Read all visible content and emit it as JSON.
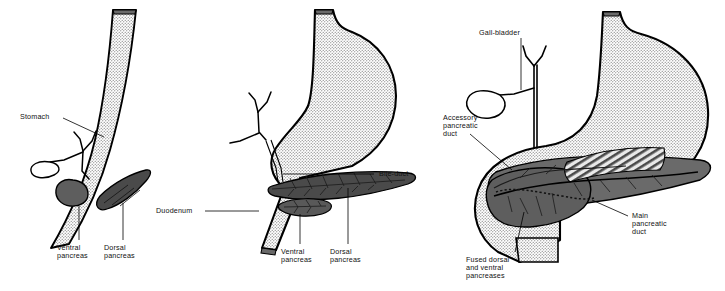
{
  "figure": {
    "type": "anatomical-diagram",
    "panel_count": 3,
    "colors": {
      "outline": "#000000",
      "stipple_fill": "#e8e8e8",
      "pancreas_dark": "#4d4d4d",
      "pancreas_mid": "#6f6f6f",
      "pancreas_light": "#8a8a8a",
      "label_text": "#111111",
      "background": "#ffffff"
    }
  },
  "panels": [
    {
      "id": "panel-left",
      "name": "early-stage",
      "labels": {
        "stomach": "Stomach",
        "ventral_pancreas": "Ventral\npancreas",
        "dorsal_pancreas": "Dorsal\npancreas"
      }
    },
    {
      "id": "panel-middle",
      "name": "intermediate-stage",
      "labels": {
        "duodenum": "Duodenum",
        "bile_duct": "Bile-duct",
        "ventral_pancreas": "Ventral\npancreas",
        "dorsal_pancreas": "Dorsal\npancreas"
      }
    },
    {
      "id": "panel-right",
      "name": "fused-stage",
      "labels": {
        "gall_bladder": "Gall-bladder",
        "accessory_pancreatic_duct": "Accessory\npancreatic\nduct",
        "main_pancreatic_duct": "Main\npancreatic\nduct",
        "fused_pancreases": "Fused dorsal\nand ventral\npancreases"
      }
    }
  ],
  "labels_flat": {
    "stomach": "Stomach",
    "ventral_pancreas_1": "Ventral",
    "ventral_pancreas_2": "pancreas",
    "dorsal_pancreas_1": "Dorsal",
    "dorsal_pancreas_2": "pancreas",
    "duodenum": "Duodenum",
    "bile_duct": "Bile-duct",
    "ventral_pancreas_m1": "Ventral",
    "ventral_pancreas_m2": "pancreas",
    "dorsal_pancreas_m1": "Dorsal",
    "dorsal_pancreas_m2": "pancreas",
    "gall_bladder": "Gall-bladder",
    "accessory_duct_1": "Accessory",
    "accessory_duct_2": "pancreatic",
    "accessory_duct_3": "duct",
    "main_duct_1": "Main",
    "main_duct_2": "pancreatic",
    "main_duct_3": "duct",
    "fused_1": "Fused dorsal",
    "fused_2": "and ventral",
    "fused_3": "pancreases"
  }
}
